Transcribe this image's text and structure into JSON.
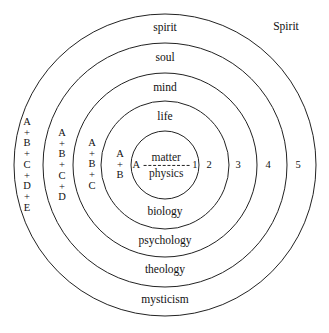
{
  "diagram": {
    "title_outside": "Spirit",
    "center": {
      "left_letter": "A",
      "right_number": "1",
      "numerator": "matter",
      "denominator": "physics",
      "divider": "dashed"
    },
    "rings": [
      {
        "index": 1,
        "radius": 34,
        "top_label": "",
        "bottom_label": "",
        "number": "1",
        "sum": "A"
      },
      {
        "index": 2,
        "radius": 64,
        "top_label": "life",
        "bottom_label": "biology",
        "number": "2",
        "sum": [
          "A",
          "+",
          "B"
        ]
      },
      {
        "index": 3,
        "radius": 92,
        "top_label": "mind",
        "bottom_label": "psychology",
        "number": "3",
        "sum": [
          "A",
          "+",
          "B",
          "+",
          "C"
        ]
      },
      {
        "index": 4,
        "radius": 122,
        "top_label": "soul",
        "bottom_label": "theology",
        "number": "4",
        "sum": [
          "A",
          "+",
          "B",
          "+",
          "C",
          "+",
          "D"
        ]
      },
      {
        "index": 5,
        "radius": 151,
        "top_label": "spirit",
        "bottom_label": "mysticism",
        "number": "5",
        "sum": [
          "A",
          "+",
          "B",
          "+",
          "C",
          "+",
          "D",
          "+",
          "E"
        ]
      }
    ],
    "top_labels": [
      "spirit",
      "soul",
      "mind",
      "life"
    ],
    "bottom_labels": [
      "biology",
      "psychology",
      "theology",
      "mysticism"
    ],
    "numbers": [
      "1",
      "2",
      "3",
      "4",
      "5"
    ],
    "colors": {
      "stroke": "#222222",
      "text": "#111111",
      "background": "#ffffff"
    }
  }
}
